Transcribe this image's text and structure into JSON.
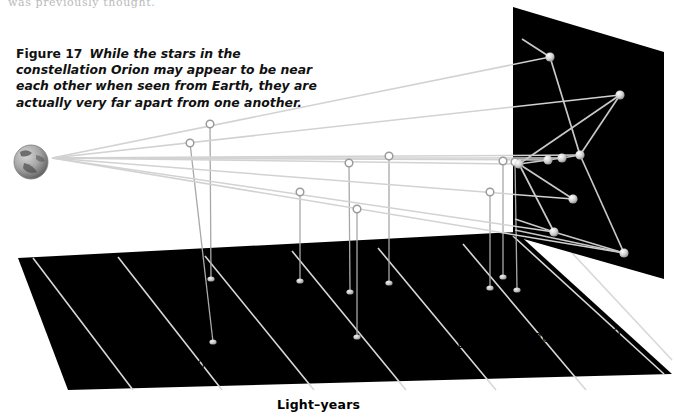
{
  "page": {
    "cut_off_line": "was previously thought.",
    "background": "#ffffff"
  },
  "caption": {
    "figure_label": "Figure 17",
    "text": "While the stars in the constellation Orion may appear to be near each other when seen from Earth, they are actually very far apart from one another."
  },
  "axis": {
    "title": "Light–years",
    "ticks": [
      {
        "label": "0",
        "value": 0
      },
      {
        "label": "200",
        "value": 200
      },
      {
        "label": "400",
        "value": 400
      },
      {
        "label": "600",
        "value": 600
      },
      {
        "label": "800",
        "value": 800
      },
      {
        "label": "1,000",
        "value": 1000
      },
      {
        "label": "1,200",
        "value": 1200
      },
      {
        "label": "1,400",
        "value": 1400
      }
    ]
  },
  "colors": {
    "floor": "#000000",
    "sky_panel": "#000000",
    "gridline": "#d8d8d8",
    "sightline": "#d2d2d2",
    "star_fill": "#d0d0d0",
    "marker_ring": "#9a9a9a",
    "dropline": "#a8a8a8",
    "earth_light": "#c9c9c9",
    "earth_dark": "#6e6e6e",
    "text": "#111111"
  },
  "chart_data": {
    "type": "scatter",
    "xlabel": "Light–years",
    "ylabel": "",
    "xlim": [
      0,
      1500
    ],
    "grid": true,
    "legend": null,
    "note": "Sight lines from Earth (left) to stars projected on a distant sky panel (right); open circles mark each star's true distance along the light-year floor axis, with droplines to the floor.",
    "categories": [
      "star-1",
      "star-2",
      "star-3",
      "star-4",
      "star-5",
      "star-6",
      "star-7",
      "star-8",
      "star-9",
      "star-10",
      "star-11"
    ],
    "values": [
      150,
      250,
      520,
      650,
      670,
      760,
      800,
      1100,
      1150,
      1250,
      1330
    ]
  },
  "scene": {
    "earth": {
      "name": "earth-globe",
      "cx": 31,
      "cy": 162,
      "r": 17
    },
    "sky_panel": {
      "name": "sky-panel",
      "points": "513,7 664,52 664,279 513,236"
    },
    "floor": {
      "name": "floor-plane",
      "points": "18,258 516,232 672,374 68,390"
    },
    "floor_gridlines": [
      "33,258 133,390",
      "118,257 222,390",
      "205,256 314,390",
      "292,251 406,390",
      "378,248 496,390",
      "463,244 586,390",
      "513,236 664,374",
      "560,240 672,360"
    ],
    "stars": [
      {
        "name": "star-1",
        "x": 550,
        "y": 57
      },
      {
        "name": "star-2",
        "x": 620,
        "y": 95
      },
      {
        "name": "star-3",
        "x": 519,
        "y": 164
      },
      {
        "name": "star-4",
        "x": 548,
        "y": 160
      },
      {
        "name": "star-5",
        "x": 562,
        "y": 158
      },
      {
        "name": "star-6",
        "x": 580,
        "y": 155
      },
      {
        "name": "star-7",
        "x": 573,
        "y": 199
      },
      {
        "name": "star-8",
        "x": 554,
        "y": 232
      },
      {
        "name": "star-9",
        "x": 624,
        "y": 253
      }
    ],
    "constellation_lines": [
      "550,57 580,155",
      "550,57 522,39",
      "620,95 580,155",
      "620,95 519,164",
      "519,164 548,160",
      "548,160 562,158",
      "562,158 580,155",
      "519,164 573,199",
      "580,155 624,253",
      "519,164 554,232",
      "554,232 624,253",
      "554,232 515,219",
      "624,253 515,230"
    ],
    "sight_lines": [
      "52,158 550,57",
      "52,158 620,95",
      "52,158 519,164",
      "52,158 548,160",
      "52,158 562,158",
      "52,158 580,155",
      "52,158 573,199",
      "52,158 554,232",
      "52,158 624,253"
    ],
    "distance_markers": [
      {
        "name": "distance-marker-1",
        "x": 210,
        "y": 124,
        "floor_x": 211,
        "floor_y": 279
      },
      {
        "name": "distance-marker-2",
        "x": 190,
        "y": 143,
        "floor_x": 213,
        "floor_y": 342
      },
      {
        "name": "distance-marker-3",
        "x": 300,
        "y": 192,
        "floor_x": 300,
        "floor_y": 281
      },
      {
        "name": "distance-marker-4",
        "x": 349,
        "y": 163,
        "floor_x": 350,
        "floor_y": 292
      },
      {
        "name": "distance-marker-5",
        "x": 357,
        "y": 209,
        "floor_x": 357,
        "floor_y": 337
      },
      {
        "name": "distance-marker-6",
        "x": 389,
        "y": 156,
        "floor_x": 389,
        "floor_y": 283
      },
      {
        "name": "distance-marker-7",
        "x": 490,
        "y": 192,
        "floor_x": 490,
        "floor_y": 288
      },
      {
        "name": "distance-marker-8",
        "x": 503,
        "y": 161,
        "floor_x": 503,
        "floor_y": 277
      },
      {
        "name": "distance-marker-9",
        "x": 515,
        "y": 162,
        "floor_x": 517,
        "floor_y": 290
      }
    ]
  }
}
